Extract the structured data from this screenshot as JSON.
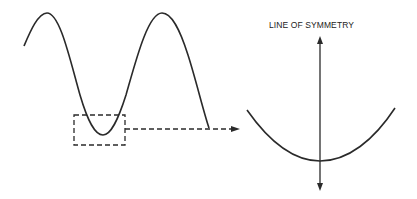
{
  "diagram": {
    "title": "",
    "labels": {
      "line_of_symmetry": "LINE OF SYMMETRY"
    },
    "elements": {
      "wave": "sine-like wave with two crests and one trough",
      "highlight_box": "dashed rectangle around the trough",
      "connector": "dashed arrow pointing right to magnified view",
      "magnified_view": "U-shaped trough curve",
      "symmetry_axis": "vertical double-headed arrow through trough minimum"
    },
    "colors": {
      "stroke": "#2a2a2a",
      "background": "#ffffff"
    }
  }
}
